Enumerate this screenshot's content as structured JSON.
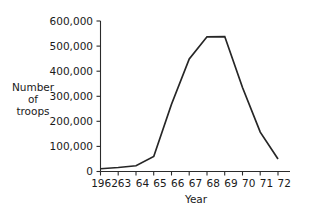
{
  "chart_data": {
    "type": "line",
    "title": "",
    "xlabel": "Year",
    "ylabel": "Number of troops",
    "ylabel_lines": [
      "Number",
      "of",
      "troops"
    ],
    "categories": [
      "1962",
      "63",
      "64",
      "65",
      "66",
      "67",
      "68",
      "69",
      "70",
      "71",
      "72"
    ],
    "x": [
      1962,
      1963,
      1964,
      1965,
      1966,
      1967,
      1968,
      1969,
      1970,
      1971,
      1972
    ],
    "values": [
      11000,
      16000,
      23000,
      60000,
      268000,
      449000,
      537000,
      538000,
      335000,
      157000,
      50000
    ],
    "series": [
      {
        "name": "Number of troops",
        "values": [
          11000,
          16000,
          23000,
          60000,
          268000,
          449000,
          537000,
          538000,
          335000,
          157000,
          50000
        ]
      }
    ],
    "ylim": [
      0,
      600000
    ],
    "ytick_values": [
      0,
      100000,
      200000,
      300000,
      400000,
      500000,
      600000
    ],
    "ytick_labels": [
      "0",
      "100,000",
      "200,000",
      "300,000",
      "400,000",
      "500,000",
      "600,000"
    ],
    "grid": false,
    "legend": false,
    "legend_position": "none",
    "line_color": "#262626",
    "axis_color": "#2b2b2b",
    "background_color": "#ffffff"
  }
}
